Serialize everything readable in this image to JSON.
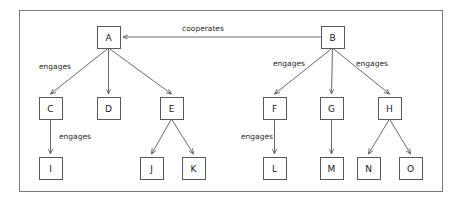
{
  "diagram": {
    "frame": {
      "x": 19,
      "y": 10,
      "width": 424,
      "height": 182
    },
    "colors": {
      "background": "#ffffff",
      "node_stroke": "#595959",
      "node_fill": "#ffffff",
      "edge_stroke": "#595959",
      "frame_stroke": "#7a7a7a",
      "text": "#1a1a1a"
    },
    "node_size": {
      "width": 23,
      "height": 22
    },
    "nodes": [
      {
        "id": "A",
        "label": "A",
        "x": 97,
        "y": 26
      },
      {
        "id": "B",
        "label": "B",
        "x": 321,
        "y": 26
      },
      {
        "id": "C",
        "label": "C",
        "x": 39,
        "y": 97
      },
      {
        "id": "D",
        "label": "D",
        "x": 97,
        "y": 97
      },
      {
        "id": "E",
        "label": "E",
        "x": 160,
        "y": 97
      },
      {
        "id": "F",
        "label": "F",
        "x": 263,
        "y": 97
      },
      {
        "id": "G",
        "label": "G",
        "x": 320,
        "y": 97
      },
      {
        "id": "H",
        "label": "H",
        "x": 378,
        "y": 97
      },
      {
        "id": "I",
        "label": "I",
        "x": 39,
        "y": 157
      },
      {
        "id": "J",
        "label": "J",
        "x": 140,
        "y": 157
      },
      {
        "id": "K",
        "label": "K",
        "x": 182,
        "y": 157
      },
      {
        "id": "L",
        "label": "L",
        "x": 263,
        "y": 157
      },
      {
        "id": "M",
        "label": "M",
        "x": 320,
        "y": 157
      },
      {
        "id": "N",
        "label": "N",
        "x": 357,
        "y": 157
      },
      {
        "id": "O",
        "label": "O",
        "x": 399,
        "y": 157
      }
    ],
    "edges": [
      {
        "id": "B-A",
        "from": "B",
        "to": "A",
        "label": "cooperates",
        "kind": "horizontal"
      },
      {
        "id": "A-C",
        "from": "A",
        "to": "C",
        "label": "engages",
        "kind": "tree"
      },
      {
        "id": "A-D",
        "from": "A",
        "to": "D",
        "label": "",
        "kind": "tree"
      },
      {
        "id": "A-E",
        "from": "A",
        "to": "E",
        "label": "",
        "kind": "tree"
      },
      {
        "id": "C-I",
        "from": "C",
        "to": "I",
        "label": "engages",
        "kind": "tree"
      },
      {
        "id": "E-J",
        "from": "E",
        "to": "J",
        "label": "",
        "kind": "tree"
      },
      {
        "id": "E-K",
        "from": "E",
        "to": "K",
        "label": "",
        "kind": "tree"
      },
      {
        "id": "B-F",
        "from": "B",
        "to": "F",
        "label": "engages",
        "kind": "tree"
      },
      {
        "id": "B-G",
        "from": "B",
        "to": "G",
        "label": "",
        "kind": "tree"
      },
      {
        "id": "B-H",
        "from": "B",
        "to": "H",
        "label": "engages",
        "kind": "tree"
      },
      {
        "id": "F-L",
        "from": "F",
        "to": "L",
        "label": "engages",
        "kind": "tree"
      },
      {
        "id": "G-M",
        "from": "G",
        "to": "M",
        "label": "",
        "kind": "tree"
      },
      {
        "id": "H-N",
        "from": "H",
        "to": "N",
        "label": "",
        "kind": "tree"
      },
      {
        "id": "H-O",
        "from": "H",
        "to": "O",
        "label": "",
        "kind": "tree"
      }
    ],
    "edge_labels": [
      {
        "id": "label-cooperates",
        "text": "cooperates",
        "x": 203,
        "y": 28
      },
      {
        "id": "label-engages-a-c",
        "text": "engages",
        "x": 55,
        "y": 66
      },
      {
        "id": "label-engages-b-f",
        "text": "engages",
        "x": 289,
        "y": 63
      },
      {
        "id": "label-engages-b-h",
        "text": "engages",
        "x": 372,
        "y": 63
      },
      {
        "id": "label-engages-c-i",
        "text": "engages",
        "x": 75,
        "y": 136
      },
      {
        "id": "label-engages-f-l",
        "text": "engages",
        "x": 257,
        "y": 136
      }
    ]
  }
}
